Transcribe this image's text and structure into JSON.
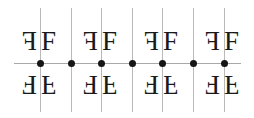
{
  "figure": {
    "width": 254,
    "height": 118,
    "background_color": "#ffffff",
    "line_color_vertical": "#b9b9b9",
    "line_color_horizontal": "#a8a8a8",
    "dot_color": "#161616",
    "motif_color": "#1a1a1a"
  },
  "motif": {
    "glyph": "F",
    "font_size_px": 27,
    "orientations": {
      "upper_left": "mirrored-horizontally",
      "upper_right": "normal",
      "lower_left": "rotated-180",
      "lower_right": "mirrored-vertically"
    }
  },
  "mirror_lines": {
    "vertical": [
      {
        "x": 40,
        "top": 8,
        "bottom": 112
      },
      {
        "x": 71,
        "top": 8,
        "bottom": 112
      },
      {
        "x": 101,
        "top": 8,
        "bottom": 112
      },
      {
        "x": 132,
        "top": 8,
        "bottom": 112
      },
      {
        "x": 162,
        "top": 8,
        "bottom": 112
      },
      {
        "x": 193,
        "top": 8,
        "bottom": 112
      },
      {
        "x": 224,
        "top": 8,
        "bottom": 112
      }
    ],
    "horizontal": [
      {
        "y": 63,
        "left": 14,
        "right": 241
      }
    ]
  },
  "rotation_centers": [
    {
      "x": 40,
      "y": 63
    },
    {
      "x": 71,
      "y": 63
    },
    {
      "x": 101,
      "y": 63
    },
    {
      "x": 132,
      "y": 63
    },
    {
      "x": 162,
      "y": 63
    },
    {
      "x": 193,
      "y": 63
    },
    {
      "x": 224,
      "y": 63
    }
  ],
  "motifs": [
    {
      "x": 22,
      "y": 28,
      "variant": "mir-x"
    },
    {
      "x": 41,
      "y": 28,
      "variant": "none"
    },
    {
      "x": 22,
      "y": 71,
      "variant": "mir-xy"
    },
    {
      "x": 41,
      "y": 71,
      "variant": "mir-y"
    },
    {
      "x": 83,
      "y": 28,
      "variant": "mir-x"
    },
    {
      "x": 102,
      "y": 28,
      "variant": "none"
    },
    {
      "x": 83,
      "y": 71,
      "variant": "mir-xy"
    },
    {
      "x": 102,
      "y": 71,
      "variant": "mir-y"
    },
    {
      "x": 144,
      "y": 28,
      "variant": "mir-x"
    },
    {
      "x": 163,
      "y": 28,
      "variant": "none"
    },
    {
      "x": 144,
      "y": 71,
      "variant": "mir-xy"
    },
    {
      "x": 163,
      "y": 71,
      "variant": "mir-y"
    },
    {
      "x": 205,
      "y": 28,
      "variant": "mir-x"
    },
    {
      "x": 224,
      "y": 28,
      "variant": "none"
    },
    {
      "x": 205,
      "y": 71,
      "variant": "mir-xy"
    },
    {
      "x": 224,
      "y": 71,
      "variant": "mir-y"
    }
  ]
}
